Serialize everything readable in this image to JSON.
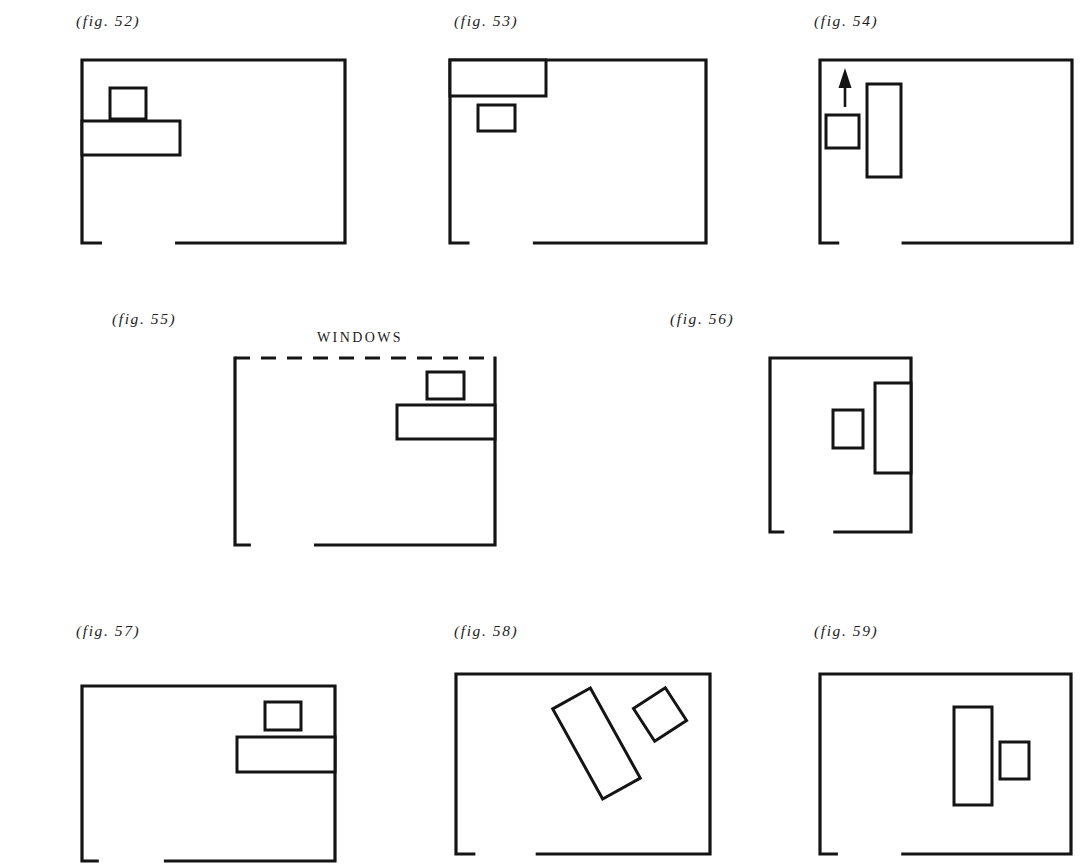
{
  "page": {
    "width": 1081,
    "height": 867,
    "background": "#ffffff",
    "ink": "#141414",
    "kind": "architectural-plan-figure-sheet"
  },
  "figures": [
    {
      "id": "fig-52",
      "caption": "(fig. 52)",
      "caption_x": 76,
      "caption_y": 12,
      "room": {
        "x": 82,
        "y": 60,
        "width": 263,
        "height": 183,
        "top_edge": "solid"
      },
      "door_gap": {
        "edge": "bottom",
        "start_fraction": 0.07,
        "end_fraction": 0.36
      },
      "objects": [
        {
          "name": "small-rect",
          "x": 110,
          "y": 88,
          "width": 36,
          "height": 31,
          "rotation": 0
        },
        {
          "name": "long-rect-on-left-wall",
          "x": 82,
          "y": 121,
          "width": 98,
          "height": 34,
          "rotation": 0
        }
      ],
      "labels": []
    },
    {
      "id": "fig-53",
      "caption": "(fig. 53)",
      "caption_x": 454,
      "caption_y": 12,
      "room": {
        "x": 450,
        "y": 60,
        "width": 256,
        "height": 183,
        "top_edge": "solid"
      },
      "door_gap": {
        "edge": "bottom",
        "start_fraction": 0.07,
        "end_fraction": 0.33
      },
      "objects": [
        {
          "name": "long-rect-in-corner",
          "x": 450,
          "y": 60,
          "width": 96,
          "height": 36,
          "rotation": 0
        },
        {
          "name": "small-rect",
          "x": 478,
          "y": 105,
          "width": 37,
          "height": 26,
          "rotation": 0
        }
      ],
      "labels": []
    },
    {
      "id": "fig-54",
      "caption": "(fig. 54)",
      "caption_x": 814,
      "caption_y": 12,
      "room": {
        "x": 820,
        "y": 60,
        "width": 252,
        "height": 183,
        "top_edge": "solid"
      },
      "door_gap": {
        "edge": "bottom",
        "start_fraction": 0.07,
        "end_fraction": 0.33
      },
      "objects": [
        {
          "name": "small-rect",
          "x": 826,
          "y": 115,
          "width": 33,
          "height": 33,
          "rotation": 0
        },
        {
          "name": "tall-rect",
          "x": 867,
          "y": 84,
          "width": 34,
          "height": 93,
          "rotation": 0
        }
      ],
      "arrow": {
        "name": "up-arrow",
        "x": 845,
        "y_tail": 107,
        "y_head": 68
      },
      "labels": []
    },
    {
      "id": "fig-55",
      "caption": "(fig. 55)",
      "caption_x": 112,
      "caption_y": 310,
      "room": {
        "x": 235,
        "y": 358,
        "width": 260,
        "height": 187,
        "top_edge": "dashed"
      },
      "door_gap": {
        "edge": "bottom",
        "start_fraction": 0.055,
        "end_fraction": 0.31
      },
      "objects": [
        {
          "name": "small-rect",
          "x": 427,
          "y": 372,
          "width": 37,
          "height": 27,
          "rotation": 0
        },
        {
          "name": "long-rect-on-right-wall",
          "x": 397,
          "y": 405,
          "width": 98,
          "height": 34,
          "rotation": 0
        }
      ],
      "labels": [
        {
          "name": "windows-label",
          "text": "WINDOWS",
          "x": 317,
          "y": 330
        }
      ]
    },
    {
      "id": "fig-56",
      "caption": "(fig. 56)",
      "caption_x": 670,
      "caption_y": 310,
      "room": {
        "x": 770,
        "y": 358,
        "width": 141,
        "height": 174,
        "top_edge": "solid"
      },
      "door_gap": {
        "edge": "bottom",
        "start_fraction": 0.09,
        "end_fraction": 0.46
      },
      "objects": [
        {
          "name": "small-rect",
          "x": 833,
          "y": 410,
          "width": 30,
          "height": 38,
          "rotation": 0
        },
        {
          "name": "tall-rect-on-right-wall",
          "x": 875,
          "y": 383,
          "width": 36,
          "height": 90,
          "rotation": 0
        }
      ],
      "labels": []
    },
    {
      "id": "fig-57",
      "caption": "(fig. 57)",
      "caption_x": 76,
      "caption_y": 622,
      "room": {
        "x": 82,
        "y": 686,
        "width": 253,
        "height": 175,
        "top_edge": "solid"
      },
      "door_gap": {
        "edge": "bottom",
        "start_fraction": 0.06,
        "end_fraction": 0.33
      },
      "objects": [
        {
          "name": "small-rect",
          "x": 265,
          "y": 702,
          "width": 36,
          "height": 28,
          "rotation": 0
        },
        {
          "name": "long-rect-on-right-wall",
          "x": 237,
          "y": 737,
          "width": 98,
          "height": 35,
          "rotation": 0
        }
      ],
      "labels": []
    },
    {
      "id": "fig-58",
      "caption": "(fig. 58)",
      "caption_x": 454,
      "caption_y": 622,
      "room": {
        "x": 456,
        "y": 674,
        "width": 254,
        "height": 180,
        "top_edge": "solid"
      },
      "door_gap": {
        "edge": "bottom",
        "start_fraction": 0.07,
        "end_fraction": 0.32
      },
      "objects": [
        {
          "name": "tilted-long-rect",
          "x": 575,
          "y": 692,
          "width": 43,
          "height": 103,
          "rotation": -29
        },
        {
          "name": "tilted-small-rect",
          "x": 641,
          "y": 695,
          "width": 38,
          "height": 39,
          "rotation": -33
        }
      ],
      "labels": []
    },
    {
      "id": "fig-59",
      "caption": "(fig. 59)",
      "caption_x": 814,
      "caption_y": 622,
      "room": {
        "x": 820,
        "y": 674,
        "width": 251,
        "height": 180,
        "top_edge": "solid"
      },
      "door_gap": {
        "edge": "bottom",
        "start_fraction": 0.065,
        "end_fraction": 0.33
      },
      "objects": [
        {
          "name": "tall-rect",
          "x": 954,
          "y": 707,
          "width": 38,
          "height": 98,
          "rotation": 0
        },
        {
          "name": "small-rect",
          "x": 1000,
          "y": 742,
          "width": 29,
          "height": 37,
          "rotation": 0
        }
      ],
      "labels": []
    }
  ]
}
